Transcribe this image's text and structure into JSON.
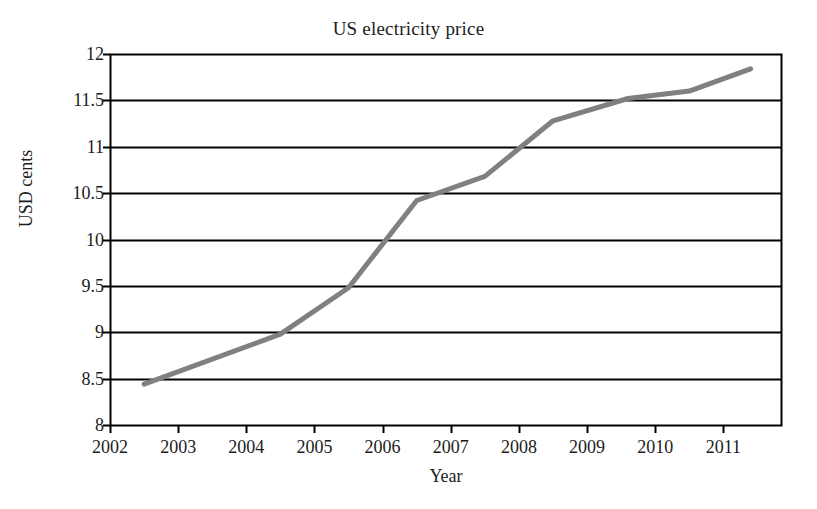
{
  "chart_data": {
    "type": "line",
    "title": "US electricity price",
    "xlabel": "Year",
    "ylabel": "USD cents",
    "xlim": [
      2002,
      2011.86
    ],
    "ylim": [
      8,
      12
    ],
    "grid": true,
    "legend": false,
    "x_ticks": [
      "2002",
      "2003",
      "2004",
      "2005",
      "2006",
      "2007",
      "2008",
      "2009",
      "2010",
      "2011"
    ],
    "y_ticks": [
      "8",
      "8.5",
      "9",
      "9.5",
      "10",
      "10.5",
      "11",
      "11.5",
      "12"
    ],
    "series": [
      {
        "name": "US electricity price",
        "color": "#808080",
        "x": [
          2002.5,
          2004.5,
          2005.5,
          2006.5,
          2007.5,
          2008.5,
          2009.6,
          2010.5,
          2011.4
        ],
        "values": [
          8.44,
          8.98,
          9.48,
          10.42,
          10.68,
          11.28,
          11.52,
          11.6,
          11.84
        ]
      }
    ]
  },
  "style": {
    "line_color": "#808080",
    "axis_color": "#000000",
    "background": "#ffffff"
  }
}
